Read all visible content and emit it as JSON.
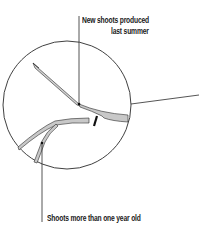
{
  "diagram": {
    "labels": {
      "new_shoots_line1": "New shoots produced",
      "new_shoots_line2": "last summer",
      "old_shoots": "Shoots more than one year old"
    },
    "colors": {
      "stroke": "#2a2a2a",
      "shoot_fill": "#c8c8c8",
      "background": "#ffffff"
    }
  }
}
